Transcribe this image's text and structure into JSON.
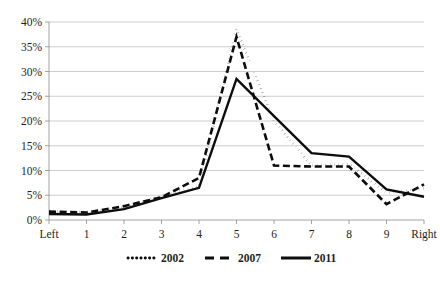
{
  "chart_data": {
    "type": "line",
    "title": "",
    "subtitle": "",
    "xlabel": "",
    "ylabel": "",
    "categories": [
      "Left",
      "1",
      "2",
      "3",
      "4",
      "5",
      "6",
      "7",
      "8",
      "9",
      "Right"
    ],
    "ylim": [
      0,
      40
    ],
    "ytick_labels": [
      "0%",
      "5%",
      "10%",
      "15%",
      "20%",
      "25%",
      "30%",
      "35%",
      "40%"
    ],
    "ytick_values": [
      0,
      5,
      10,
      15,
      20,
      25,
      30,
      35,
      40
    ],
    "y_unit": "%",
    "grid": "horizontal",
    "legend_position": "bottom",
    "series": [
      {
        "name": "2002",
        "style": "dotted",
        "color": "#0d0d0d",
        "values": [
          1.8,
          1.6,
          2.6,
          4.8,
          6.8,
          38.5,
          20.0,
          11.0,
          11.3,
          5.5,
          6.4
        ]
      },
      {
        "name": "2007",
        "style": "dashed",
        "color": "#0d0d0d",
        "values": [
          1.7,
          1.5,
          2.8,
          4.6,
          8.5,
          37.0,
          11.0,
          10.8,
          10.8,
          3.2,
          7.2
        ]
      },
      {
        "name": "2011",
        "style": "solid",
        "color": "#0d0d0d",
        "values": [
          1.2,
          1.1,
          2.2,
          4.4,
          6.5,
          28.5,
          21.0,
          13.5,
          12.8,
          6.2,
          4.7
        ]
      }
    ]
  },
  "legend": {
    "items": [
      {
        "label": "2002",
        "style": "dotted"
      },
      {
        "label": "2007",
        "style": "dashed"
      },
      {
        "label": "2011",
        "style": "solid"
      }
    ]
  },
  "colors": {
    "background": "#ffffff",
    "gridline": "#b7b7b7",
    "axis": "#8c8c8c",
    "ink": "#0d0d0d",
    "text": "#231f20"
  }
}
